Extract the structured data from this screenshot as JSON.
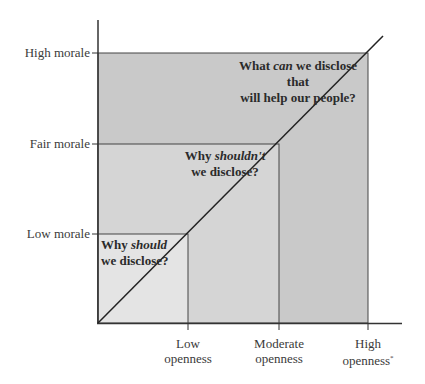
{
  "diagram": {
    "type": "nested-region-diagram",
    "y_axis": {
      "labels": [
        "High morale",
        "Fair morale",
        "Low morale"
      ]
    },
    "x_axis": {
      "labels": [
        {
          "line1": "Low",
          "line2": "openness"
        },
        {
          "line1": "Moderate",
          "line2": "openness"
        },
        {
          "line1": "High",
          "line2": "openness"
        }
      ],
      "footnote_mark": "*"
    },
    "regions": [
      {
        "id": "high",
        "q_pre": "What ",
        "q_em": "can",
        "q_post": " we disclose that",
        "q_line2": "will help our people?",
        "fill": "#c9c9c9"
      },
      {
        "id": "fair",
        "q_pre": "Why ",
        "q_em": "shouldn't",
        "q_post": "",
        "q_line2": "we disclose?",
        "fill": "#d5d5d5"
      },
      {
        "id": "low",
        "q_pre": "Why ",
        "q_em": "should",
        "q_post": "",
        "q_line2": "we disclose?",
        "fill": "#e4e4e4"
      }
    ],
    "line_color": "#333333"
  }
}
